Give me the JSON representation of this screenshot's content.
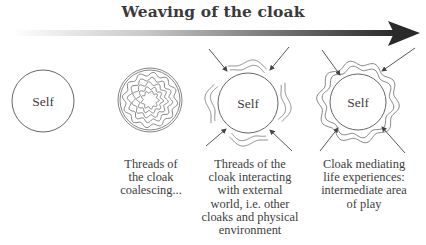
{
  "title": "Weaving of the cloak",
  "arrow": {
    "direction": "left-to-right",
    "gradient_start": "#ffffff",
    "gradient_end": "#2a2a2a"
  },
  "stages": [
    {
      "label": "Self",
      "caption_lines": []
    },
    {
      "label": "",
      "caption_lines": [
        "Threads of",
        "the cloak",
        "coalescing..."
      ]
    },
    {
      "label": "Self",
      "caption_lines": [
        "Threads of the",
        "cloak interacting",
        "with external",
        "world, i.e. other",
        "cloaks and physical",
        "environment"
      ]
    },
    {
      "label": "Self",
      "caption_lines": [
        "Cloak mediating",
        "life experiences:",
        "intermediate area",
        "of play"
      ]
    }
  ]
}
